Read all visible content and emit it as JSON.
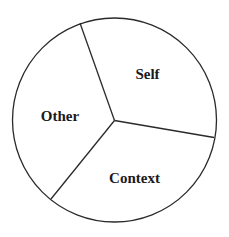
{
  "diagram": {
    "type": "circle-divided-into-three-sectors",
    "stroke_color": "#2a2a2a",
    "fill_color": "#ffffff",
    "text_color": "#1a1a1a",
    "sectors": [
      {
        "label": "Self",
        "position": "upper-right"
      },
      {
        "label": "Other",
        "position": "left"
      },
      {
        "label": "Context",
        "position": "bottom"
      }
    ]
  }
}
